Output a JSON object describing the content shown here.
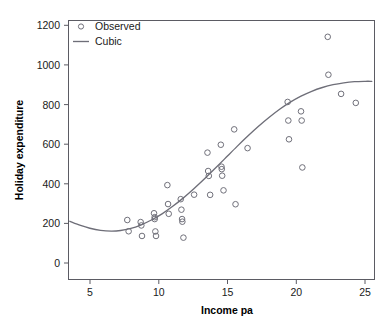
{
  "chart_data": {
    "type": "scatter",
    "title": "",
    "xlabel": "Income pa",
    "ylabel": "Holiday expenditure",
    "xlim": [
      3.6,
      26.5
    ],
    "ylim": [
      -110,
      1270
    ],
    "xticks": [
      5,
      10,
      15,
      20,
      25
    ],
    "yticks": [
      0,
      200,
      400,
      600,
      800,
      1000,
      1200
    ],
    "xtick_labels": [
      "5",
      "10",
      "15",
      "20",
      "25"
    ],
    "ytick_labels": [
      "0",
      "200",
      "400",
      "600",
      "800",
      "1000",
      "1200"
    ],
    "grid": false,
    "legend_position": "top-left",
    "legend": [
      {
        "label": "Observed",
        "marker": "open-circle",
        "color": "#70707a"
      },
      {
        "label": "Cubic",
        "marker": "line",
        "color": "#6e6e78"
      }
    ],
    "series": [
      {
        "name": "Observed",
        "type": "scatter",
        "marker": "open-circle",
        "color": "#70707a",
        "points": [
          [
            8.0,
            207
          ],
          [
            8.1,
            147
          ],
          [
            9.0,
            196
          ],
          [
            9.05,
            178
          ],
          [
            9.1,
            122
          ],
          [
            10.0,
            243
          ],
          [
            10.05,
            222
          ],
          [
            10.05,
            212
          ],
          [
            10.1,
            146
          ],
          [
            10.15,
            122
          ],
          [
            11.0,
            393
          ],
          [
            11.05,
            292
          ],
          [
            11.1,
            240
          ],
          [
            12.0,
            318
          ],
          [
            12.05,
            262
          ],
          [
            12.1,
            212
          ],
          [
            12.12,
            198
          ],
          [
            12.2,
            113
          ],
          [
            13.0,
            342
          ],
          [
            14.0,
            566
          ],
          [
            14.05,
            468
          ],
          [
            14.1,
            442
          ],
          [
            14.2,
            341
          ],
          [
            15.0,
            608
          ],
          [
            15.05,
            491
          ],
          [
            15.07,
            478
          ],
          [
            15.1,
            443
          ],
          [
            15.2,
            365
          ],
          [
            16.0,
            690
          ],
          [
            16.1,
            291
          ],
          [
            17.0,
            590
          ],
          [
            20.0,
            836
          ],
          [
            20.05,
            737
          ],
          [
            20.1,
            637
          ],
          [
            21.0,
            786
          ],
          [
            21.05,
            737
          ],
          [
            21.1,
            487
          ],
          [
            23.0,
            1183
          ],
          [
            23.05,
            981
          ],
          [
            24.0,
            879
          ],
          [
            25.1,
            831
          ]
        ]
      },
      {
        "name": "Cubic",
        "type": "line",
        "color": "#6e6e78",
        "points": [
          [
            3.7,
            200
          ],
          [
            4.5,
            178
          ],
          [
            5.2,
            163
          ],
          [
            6.0,
            152
          ],
          [
            6.8,
            148
          ],
          [
            7.5,
            151
          ],
          [
            8.2,
            161
          ],
          [
            9.0,
            180
          ],
          [
            9.8,
            207
          ],
          [
            10.6,
            240
          ],
          [
            11.4,
            280
          ],
          [
            12.2,
            325
          ],
          [
            13.0,
            375
          ],
          [
            13.8,
            428
          ],
          [
            14.6,
            484
          ],
          [
            15.4,
            541
          ],
          [
            16.2,
            598
          ],
          [
            17.0,
            653
          ],
          [
            17.8,
            705
          ],
          [
            18.6,
            753
          ],
          [
            19.4,
            797
          ],
          [
            20.2,
            835
          ],
          [
            21.0,
            867
          ],
          [
            21.8,
            893
          ],
          [
            22.6,
            913
          ],
          [
            23.4,
            928
          ],
          [
            24.2,
            938
          ],
          [
            25.0,
            944
          ],
          [
            25.8,
            946
          ],
          [
            26.3,
            946
          ]
        ]
      }
    ]
  },
  "axes": {
    "x_title": "Income pa",
    "y_title": "Holiday expenditure"
  }
}
